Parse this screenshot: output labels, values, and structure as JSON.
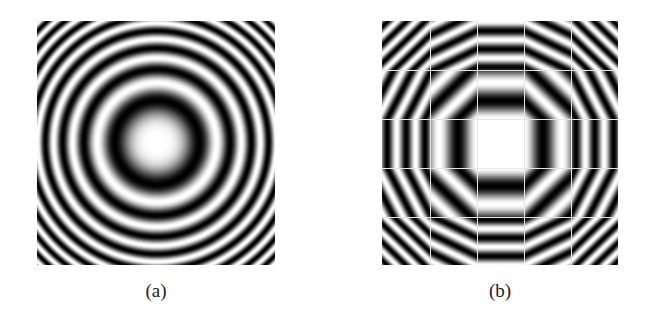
{
  "figure": {
    "panels": [
      {
        "id": "a",
        "caption": "(a)",
        "description": "Concentric fringe pattern (zone-plate / Newton's rings): bright center, alternating dark and bright rings that get narrower with radius",
        "pattern": {
          "type": "radial-quadratic-phase",
          "intensity": "0.5 + 0.5*cos(2*pi*r^2/period)",
          "r2_period_px2": 3560,
          "center_bright": true
        }
      },
      {
        "id": "b",
        "caption": "(b)",
        "description": "Same pattern approximated piecewise by a 5x5 grid of tiles, each tile filled with straight (linear-phase) fringes; center tile near-uniform white",
        "pattern": {
          "type": "tiled-linear-phase-approximation",
          "grid_rows": 5,
          "grid_cols": 5,
          "r2_period_px2": 3560,
          "seam_color": "#e6e6e6"
        }
      }
    ]
  },
  "colors": {
    "background": "#ffffff",
    "fringe_dark": "#000000",
    "fringe_light": "#ffffff",
    "caption_text": "#222222"
  }
}
